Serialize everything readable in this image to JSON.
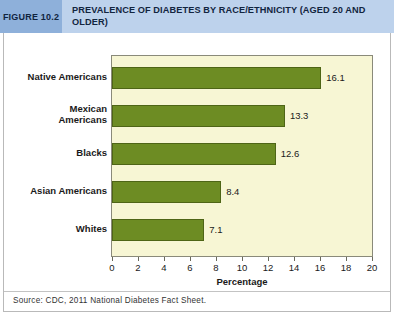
{
  "header": {
    "figure_tag": "FIGURE 10.2",
    "title": "PREVALENCE OF DIABETES BY RACE/ETHNICITY (AGED 20 AND OLDER)"
  },
  "source": "Source: CDC, 2011 National Diabetes Fact Sheet.",
  "colors": {
    "header_band": "#bdd2ec",
    "figure_tag_bg": "#8eb0da",
    "bar_fill": "#6d8c23",
    "bar_stroke": "#4e6516",
    "plot_bg": "#f7f6d4",
    "frame_border": "#b9b9b9"
  },
  "chart_data": {
    "type": "bar",
    "orientation": "horizontal",
    "title": "PREVALENCE OF DIABETES BY RACE/ETHNICITY (AGED 20 AND OLDER)",
    "categories": [
      "Native Americans",
      "Mexican Americans",
      "Blacks",
      "Asian Americans",
      "Whites"
    ],
    "values": [
      16.1,
      13.3,
      12.6,
      8.4,
      7.1
    ],
    "data_labels": [
      "16.1",
      "13.3",
      "12.6",
      "8.4",
      "7.1"
    ],
    "xlabel": "Percentage",
    "ylabel": "",
    "xlim": [
      0,
      20
    ],
    "xticks": [
      0,
      2,
      4,
      6,
      8,
      10,
      12,
      14,
      16,
      18,
      20
    ],
    "xtick_labels": [
      "0",
      "2",
      "4",
      "6",
      "8",
      "10",
      "12",
      "14",
      "16",
      "18",
      "20"
    ],
    "grid": false,
    "legend": false,
    "source": "Source: CDC, 2011 National Diabetes Fact Sheet."
  }
}
